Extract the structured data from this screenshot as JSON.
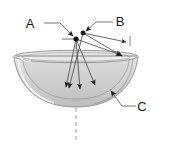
{
  "figure": {
    "background_color": "#ffffff",
    "line_color": "#555555",
    "label_color": "#1a1a1a",
    "bowl": {
      "outer_fill": "#d8d8d8",
      "inner_fill": "#c9c9c9",
      "rim_fill": "#ececec",
      "stroke": "#8a8a8a",
      "shape": "hemisphere",
      "orientation": "opening-upward"
    },
    "axis": {
      "style": "dashed",
      "orientation": "vertical",
      "color": "#777777"
    }
  },
  "labels": [
    {
      "id": "A",
      "text": "A",
      "x": 30,
      "y": 25,
      "points_to": "left-node"
    },
    {
      "id": "B",
      "text": "B",
      "x": 116,
      "y": 20,
      "points_to": "right-node"
    },
    {
      "id": "C",
      "text": "C",
      "x": 140,
      "y": 110,
      "points_to": "inner-bowl-edge"
    }
  ],
  "nodes": [
    {
      "id": "left-node",
      "x": 76,
      "y": 39,
      "label": "A"
    },
    {
      "id": "right-node",
      "x": 83,
      "y": 33,
      "label": "B"
    }
  ],
  "arrows": [
    {
      "from": "left-node",
      "to_x": 80,
      "to_y": 92,
      "name": "ray-1"
    },
    {
      "from": "left-node",
      "to_x": 96,
      "to_y": 88,
      "name": "ray-2"
    },
    {
      "from": "left-node",
      "to_x": 123,
      "to_y": 57,
      "name": "ray-3"
    },
    {
      "from": "right-node",
      "to_x": 128,
      "to_y": 44,
      "name": "ray-4"
    },
    {
      "from": "right-node",
      "to_x": 124,
      "to_y": 58,
      "name": "ray-5"
    },
    {
      "from": "right-node",
      "to_x": 68,
      "to_y": 90,
      "name": "ray-6"
    }
  ]
}
